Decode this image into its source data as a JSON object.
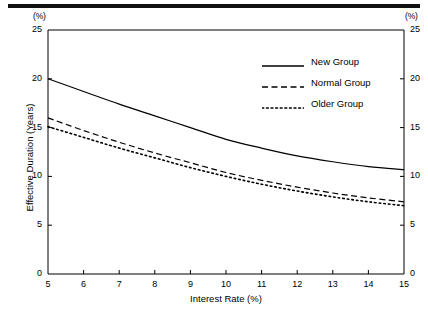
{
  "figure": {
    "unit_left": "(%)",
    "unit_right": "(%)"
  },
  "chart_data": {
    "type": "line",
    "title": "",
    "xlabel": "Interest Rate (%)",
    "ylabel": "Effective Duration (Years)",
    "x_unit": "(%)",
    "y_unit": "(%)",
    "xlim": [
      5,
      15
    ],
    "ylim": [
      0,
      25
    ],
    "xticks": [
      5,
      6,
      7,
      8,
      9,
      10,
      11,
      12,
      13,
      14,
      15
    ],
    "yticks": [
      0,
      5,
      10,
      15,
      20,
      25
    ],
    "xtick_labels": [
      "5",
      "6",
      "7",
      "8",
      "9",
      "10",
      "11",
      "12",
      "13",
      "14",
      "15"
    ],
    "ytick_labels": [
      "0",
      "5",
      "10",
      "15",
      "20",
      "25"
    ],
    "right_axis": true,
    "right_ytick_labels": [
      "0",
      "5",
      "10",
      "15",
      "20",
      "25"
    ],
    "grid": false,
    "legend_position": "upper right",
    "x": [
      5,
      6,
      7,
      8,
      9,
      10,
      11,
      12,
      13,
      14,
      15
    ],
    "series": [
      {
        "name": "New Group",
        "style": "solid",
        "color": "#000000",
        "values": [
          20.0,
          18.7,
          17.4,
          16.2,
          15.0,
          13.8,
          12.9,
          12.1,
          11.5,
          11.0,
          10.7
        ]
      },
      {
        "name": "Normal Group",
        "style": "dashed",
        "color": "#000000",
        "values": [
          16.0,
          14.7,
          13.5,
          12.4,
          11.4,
          10.4,
          9.6,
          8.9,
          8.3,
          7.8,
          7.4
        ]
      },
      {
        "name": "Older Group",
        "style": "dotted",
        "color": "#000000",
        "values": [
          15.1,
          14.0,
          12.9,
          11.9,
          10.9,
          10.0,
          9.2,
          8.5,
          7.9,
          7.4,
          7.0
        ]
      }
    ]
  }
}
